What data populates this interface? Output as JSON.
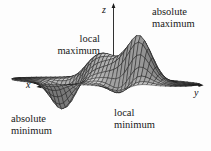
{
  "figure": {
    "labels": {
      "absolute_maximum": [
        "absolute",
        "maximum"
      ],
      "local_maximum": [
        "local",
        "maximum"
      ],
      "local_minimum": [
        "local",
        "minimum"
      ],
      "absolute_minimum": [
        "absolute",
        "minimum"
      ]
    },
    "axes": {
      "x": "x",
      "y": "y",
      "z": "z"
    },
    "colors": {
      "background": "#fdfdfd",
      "ink": "#1a1a1a",
      "mesh_stroke": "#1c1c1c",
      "surface_light": "#f2f2f2",
      "surface_dark": "#787878"
    },
    "surface": {
      "type": "3d-wireframe-mesh",
      "description": "surface of a function of two variables showing two maxima and two minima",
      "u_range": [
        -1.6,
        1.6
      ],
      "v_range": [
        -4.9,
        4.2
      ],
      "grid": {
        "rows": 14,
        "cols": 46
      },
      "envelope": {
        "center": -0.35,
        "semi_axis": 4.56
      },
      "features": [
        {
          "name": "absolute-maximum-peak",
          "amp": 7.4,
          "u": 0.3,
          "v": 1.3,
          "su": 0.5,
          "sv": 0.62
        },
        {
          "name": "local-maximum-peak",
          "amp": 3.0,
          "u": -0.7,
          "v": -1.0,
          "su": 0.55,
          "sv": 0.7
        },
        {
          "name": "absolute-minimum-valley",
          "amp": -4.3,
          "u": 0.3,
          "v": -2.3,
          "su": 0.45,
          "sv": 0.55
        },
        {
          "name": "local-minimum-valley",
          "amp": -3.6,
          "u": 0.8,
          "v": 0.9,
          "su": 0.45,
          "sv": 0.5
        },
        {
          "name": "central-saddle-ridge",
          "amp": 2.6,
          "u": -0.2,
          "v": 0.15,
          "su": 0.6,
          "sv": 0.9
        }
      ],
      "view": {
        "origin": [
          113,
          82
        ],
        "vx": [
          -9,
          2.2
        ],
        "vy": [
          20.5,
          0.7
        ],
        "vz": [
          0,
          -6.8
        ],
        "light": [
          0.3,
          -0.1,
          0.95
        ]
      }
    }
  }
}
